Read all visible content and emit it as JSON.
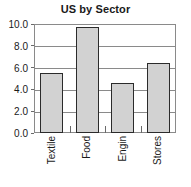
{
  "chart_data": {
    "type": "bar",
    "title": "US by Sector",
    "xlabel": "",
    "ylabel": "",
    "categories": [
      "Textile",
      "Food",
      "Engin",
      "Stores"
    ],
    "values": [
      5.5,
      9.7,
      4.6,
      6.45
    ],
    "ylim": [
      0.0,
      10.0
    ],
    "ytick_step": 2.0,
    "ytick_labels": [
      "0.0",
      "2.0",
      "4.0",
      "6.0",
      "8.0",
      "10.0"
    ],
    "ytick_values": [
      0.0,
      2.0,
      4.0,
      6.0,
      8.0,
      10.0
    ],
    "grid": true,
    "grid_axis": "y",
    "legend": false,
    "legend_position": "none",
    "bar_fill_color": "#d2d2d2",
    "bar_edge_color": "#2b2b2b",
    "axis_color": "#8a8a8a",
    "text_color": "#1a1a1a",
    "background_color": "#ffffff",
    "xtick_label_rotation": 90
  }
}
